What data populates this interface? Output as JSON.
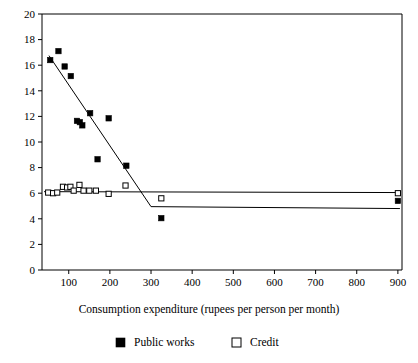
{
  "chart_data": {
    "type": "scatter",
    "title": "",
    "xlabel": "Consumption expenditure (rupees per person per month)",
    "ylabel": "",
    "xlim": [
      35,
      910
    ],
    "ylim": [
      0,
      20
    ],
    "xticks": [
      100,
      200,
      300,
      400,
      500,
      600,
      700,
      800,
      900
    ],
    "yticks": [
      0,
      2,
      4,
      6,
      8,
      10,
      12,
      14,
      16,
      18,
      20
    ],
    "grid": false,
    "legend_position": "bottom",
    "series": [
      {
        "name": "Public works",
        "marker": "filled-square",
        "color": "#000000",
        "points": [
          {
            "x": 55,
            "y": 16.4
          },
          {
            "x": 75,
            "y": 17.1
          },
          {
            "x": 90,
            "y": 15.9
          },
          {
            "x": 105,
            "y": 15.15
          },
          {
            "x": 120,
            "y": 11.65
          },
          {
            "x": 127,
            "y": 11.55
          },
          {
            "x": 133,
            "y": 11.3
          },
          {
            "x": 152,
            "y": 12.25
          },
          {
            "x": 170,
            "y": 8.65
          },
          {
            "x": 197,
            "y": 11.85
          },
          {
            "x": 240,
            "y": 8.15
          },
          {
            "x": 325,
            "y": 4.05
          },
          {
            "x": 900,
            "y": 5.4
          }
        ],
        "trend": {
          "type": "piecewise-linear",
          "vertices": [
            {
              "x": 52,
              "y": 16.75
            },
            {
              "x": 300,
              "y": 4.95
            },
            {
              "x": 905,
              "y": 4.8
            }
          ]
        }
      },
      {
        "name": "Credit",
        "marker": "open-square",
        "color": "#ffffff",
        "points": [
          {
            "x": 50,
            "y": 6.05
          },
          {
            "x": 62,
            "y": 6.0
          },
          {
            "x": 72,
            "y": 6.05
          },
          {
            "x": 86,
            "y": 6.5
          },
          {
            "x": 96,
            "y": 6.45
          },
          {
            "x": 104,
            "y": 6.5
          },
          {
            "x": 112,
            "y": 6.2
          },
          {
            "x": 126,
            "y": 6.65
          },
          {
            "x": 136,
            "y": 6.2
          },
          {
            "x": 150,
            "y": 6.2
          },
          {
            "x": 166,
            "y": 6.2
          },
          {
            "x": 197,
            "y": 5.95
          },
          {
            "x": 238,
            "y": 6.6
          },
          {
            "x": 325,
            "y": 5.6
          },
          {
            "x": 900,
            "y": 6.0
          }
        ],
        "trend": {
          "type": "linear",
          "vertices": [
            {
              "x": 40,
              "y": 6.12
            },
            {
              "x": 905,
              "y": 6.05
            }
          ]
        }
      }
    ]
  },
  "legend": {
    "items": [
      {
        "label": "Public works",
        "marker": "filled-square"
      },
      {
        "label": "Credit",
        "marker": "open-square"
      }
    ]
  }
}
